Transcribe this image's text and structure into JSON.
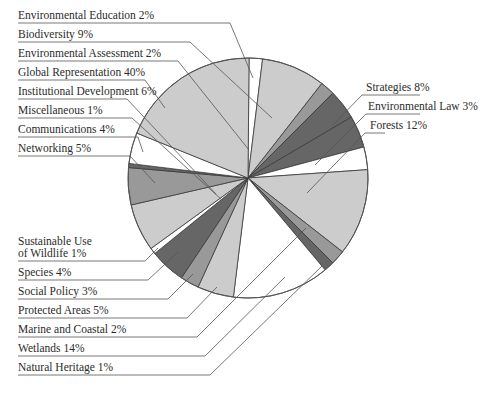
{
  "chart_data": {
    "type": "pie",
    "title": "",
    "center": [
      248,
      178
    ],
    "radius": 120,
    "slices": [
      {
        "label": "Environmental Education",
        "value": 2,
        "text": "Environmental Education 2%",
        "start_deg": 0.5,
        "end_deg": 7,
        "color": "#ffffff"
      },
      {
        "label": "Biodiversity",
        "value": 9,
        "text": "Biodiversity 9%",
        "start_deg": 7,
        "end_deg": 38,
        "color": "#cccccc"
      },
      {
        "label": "Environmental Assessment",
        "value": 2,
        "text": "Environmental Assessment 2%",
        "start_deg": 38,
        "end_deg": 45,
        "color": "#999999"
      },
      {
        "label": "Strategies",
        "value": 8,
        "text": "Strategies 8%",
        "start_deg": 45,
        "end_deg": 59.5,
        "color": "#666666"
      },
      {
        "label": "Environmental Law",
        "value": 3,
        "text": "Environmental Law 3%",
        "start_deg": 59.5,
        "end_deg": 75,
        "color": "#666666"
      },
      {
        "label": "Unlabeled (white)",
        "value": null,
        "text": "",
        "start_deg": 75,
        "end_deg": 86,
        "color": "#ffffff"
      },
      {
        "label": "Forests",
        "value": 12,
        "text": "Forests 12%",
        "start_deg": 86,
        "end_deg": 128,
        "color": "#cccccc"
      },
      {
        "label": "Marine and Coastal",
        "value": 2,
        "text": "Marine and Coastal 2%",
        "start_deg": 128,
        "end_deg": 135,
        "color": "#999999"
      },
      {
        "label": "Natural Heritage",
        "value": 1,
        "text": "Natural Heritage 1%",
        "start_deg": 135,
        "end_deg": 140,
        "color": "#666666"
      },
      {
        "label": "Wetlands",
        "value": 14,
        "text": "Wetlands 14%",
        "start_deg": 140,
        "end_deg": 187,
        "color": "#ffffff"
      },
      {
        "label": "Protected Areas",
        "value": 5,
        "text": "Protected Areas 5%",
        "start_deg": 187,
        "end_deg": 204.6,
        "color": "#cccccc"
      },
      {
        "label": "Social Policy",
        "value": 3,
        "text": "Social Policy 3%",
        "start_deg": 204.6,
        "end_deg": 213.7,
        "color": "#999999"
      },
      {
        "label": "Species",
        "value": 4,
        "text": "Species 4%",
        "start_deg": 213.7,
        "end_deg": 231,
        "color": "#666666"
      },
      {
        "label": "Sustainable Use of Wildlife",
        "value": 1,
        "text": "Sustainable Use of Wildlife 1%",
        "start_deg": 231,
        "end_deg": 234,
        "color": "#ffffff"
      },
      {
        "label": "Institutional Development",
        "value": 6,
        "text": "Institutional Development 6%",
        "start_deg": 234,
        "end_deg": 257,
        "color": "#cccccc"
      },
      {
        "label": "Networking",
        "value": 5,
        "text": "Networking 5%",
        "start_deg": 257,
        "end_deg": 275,
        "color": "#999999"
      },
      {
        "label": "Miscellaneous",
        "value": 1,
        "text": "Miscellaneous 1%",
        "start_deg": 275,
        "end_deg": 277,
        "color": "#666666"
      },
      {
        "label": "Communications",
        "value": 4,
        "text": "Communications 4%",
        "start_deg": 277,
        "end_deg": 292,
        "color": "#ffffff"
      },
      {
        "label": "Global Representation",
        "value": 40,
        "text": "Global Representation 40%",
        "start_deg": 292,
        "end_deg": 360.5,
        "color": "#cccccc"
      }
    ],
    "legend_position": "callout labels left and right",
    "grid": false
  },
  "labels_left": [
    {
      "id": "env-education",
      "lines": [
        "Environmental Education 2%"
      ],
      "y": 22,
      "underline_end": 230,
      "target": [
        253,
        78
      ]
    },
    {
      "id": "biodiversity",
      "lines": [
        "Biodiversity 9%"
      ],
      "y": 41,
      "underline_end": 190,
      "target": [
        272,
        118
      ]
    },
    {
      "id": "env-assessment",
      "lines": [
        "Environmental Assessment 2%"
      ],
      "y": 60,
      "underline_end": 178,
      "target": [
        249,
        150
      ]
    },
    {
      "id": "global-representation",
      "lines": [
        "Global Representation 40%"
      ],
      "y": 79,
      "underline_end": 145,
      "target": [
        165,
        108
      ]
    },
    {
      "id": "institutional-development",
      "lines": [
        "Institutional Development 6%"
      ],
      "y": 98,
      "underline_end": 127,
      "target": [
        216,
        194
      ]
    },
    {
      "id": "miscellaneous",
      "lines": [
        "Miscellaneous 1%"
      ],
      "y": 117,
      "underline_end": 132,
      "target": [
        222,
        200
      ]
    },
    {
      "id": "communications",
      "lines": [
        "Communications 4%"
      ],
      "y": 136,
      "underline_end": 138,
      "target": [
        143,
        152
      ]
    },
    {
      "id": "networking",
      "lines": [
        "Networking 5%"
      ],
      "y": 155,
      "underline_end": 130,
      "target": [
        155,
        183
      ]
    },
    {
      "id": "sustainable-use",
      "lines": [
        "Sustainable Use",
        "of Wildlife 1%"
      ],
      "y": 260,
      "underline_end": 145,
      "target": [
        158,
        248
      ]
    },
    {
      "id": "species",
      "lines": [
        "Species 4%"
      ],
      "y": 279,
      "underline_end": 148,
      "target": [
        178,
        252
      ]
    },
    {
      "id": "social-policy",
      "lines": [
        "Social Policy 3%"
      ],
      "y": 298,
      "underline_end": 168,
      "target": [
        193,
        274
      ]
    },
    {
      "id": "protected-areas",
      "lines": [
        "Protected Areas 5%"
      ],
      "y": 317,
      "underline_end": 187,
      "target": [
        217,
        287
      ]
    },
    {
      "id": "marine-coastal",
      "lines": [
        "Marine and Coastal 2%"
      ],
      "y": 336,
      "underline_end": 197,
      "target": [
        306,
        228
      ]
    },
    {
      "id": "wetlands",
      "lines": [
        "Wetlands 14%"
      ],
      "y": 355,
      "underline_end": 205,
      "target": [
        285,
        277
      ]
    },
    {
      "id": "natural-heritage",
      "lines": [
        "Natural Heritage 1%"
      ],
      "y": 374,
      "underline_end": 210,
      "target": [
        322,
        266
      ]
    }
  ],
  "labels_right": [
    {
      "id": "strategies",
      "lines": [
        "Strategies 8%"
      ],
      "x": 366,
      "y": 94,
      "underline_start": 362,
      "underline_end": 420,
      "target": [
        332,
        126
      ]
    },
    {
      "id": "environmental-law",
      "lines": [
        "Environmental Law 3%"
      ],
      "x": 368,
      "y": 113,
      "underline_start": 366,
      "underline_end": 420,
      "target": [
        315,
        165
      ]
    },
    {
      "id": "forests",
      "lines": [
        "Forests 12%"
      ],
      "x": 370,
      "y": 132,
      "underline_start": 365,
      "underline_end": 385,
      "target": [
        307,
        193
      ]
    }
  ]
}
